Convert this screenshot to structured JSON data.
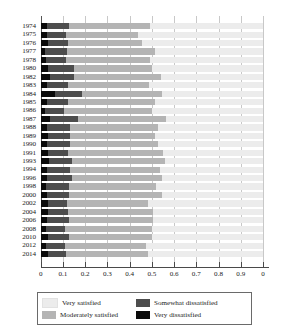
{
  "chart_data": {
    "type": "bar",
    "subtype": "stacked-horizontal-100",
    "title": "",
    "xlabel": "",
    "ylabel": "",
    "xlim": [
      0,
      1
    ],
    "ylim": null,
    "grid": true,
    "legend_position": "bottom",
    "x_tick_labels": [
      "0",
      "0.1",
      "0.2",
      "0.3",
      "0.4",
      "0.5",
      "0.6",
      "0.7",
      "0.8",
      "0.9",
      "0"
    ],
    "x_tick_values": [
      0,
      0.1,
      0.2,
      0.3,
      0.4,
      0.5,
      0.6,
      0.7,
      0.8,
      0.9,
      1.0
    ],
    "categories": [
      "1974",
      "1975",
      "1976",
      "1977",
      "1978",
      "1980",
      "1982",
      "1983",
      "1984",
      "1985",
      "1986",
      "1987",
      "1988",
      "1989",
      "1990",
      "1991",
      "1993",
      "1994",
      "1996",
      "1998",
      "2000",
      "2002",
      "2004",
      "2006",
      "2008",
      "2010",
      "2012",
      "2014"
    ],
    "series": [
      {
        "name": "Very dissatisfied",
        "color": "#0a0a0a",
        "values": [
          0.027,
          0.03,
          0.031,
          0.02,
          0.025,
          0.031,
          0.042,
          0.029,
          0.063,
          0.027,
          0.02,
          0.042,
          0.03,
          0.031,
          0.03,
          0.031,
          0.038,
          0.029,
          0.03,
          0.026,
          0.028,
          0.034,
          0.031,
          0.03,
          0.023,
          0.032,
          0.025,
          0.031
        ]
      },
      {
        "name": "Somewhat dissatisfied",
        "color": "#4d4d4d",
        "values": [
          0.099,
          0.083,
          0.094,
          0.097,
          0.09,
          0.121,
          0.108,
          0.094,
          0.122,
          0.097,
          0.083,
          0.127,
          0.103,
          0.101,
          0.101,
          0.09,
          0.102,
          0.101,
          0.112,
          0.102,
          0.101,
          0.085,
          0.091,
          0.098,
          0.088,
          0.096,
          0.085,
          0.083
        ]
      },
      {
        "name": "Moderately satisfied",
        "color": "#b4b4b4",
        "values": [
          0.364,
          0.327,
          0.33,
          0.396,
          0.375,
          0.348,
          0.39,
          0.365,
          0.363,
          0.39,
          0.4,
          0.393,
          0.396,
          0.384,
          0.399,
          0.431,
          0.421,
          0.406,
          0.406,
          0.392,
          0.415,
          0.363,
          0.382,
          0.378,
          0.389,
          0.372,
          0.366,
          0.367
        ]
      },
      {
        "name": "Very satisfied",
        "color": "#ececec",
        "values": [
          0.51,
          0.56,
          0.545,
          0.487,
          0.51,
          0.5,
          0.46,
          0.512,
          0.452,
          0.486,
          0.497,
          0.438,
          0.471,
          0.484,
          0.47,
          0.448,
          0.439,
          0.464,
          0.452,
          0.48,
          0.456,
          0.518,
          0.496,
          0.494,
          0.5,
          0.5,
          0.524,
          0.519
        ]
      }
    ],
    "legend": [
      {
        "label": "Very satisfied",
        "color": "#ececec"
      },
      {
        "label": "Somewhat dissatisfied",
        "color": "#4d4d4d"
      },
      {
        "label": "Moderately satisfied",
        "color": "#b4b4b4"
      },
      {
        "label": "Very dissatisfied",
        "color": "#0a0a0a"
      }
    ]
  },
  "colors": {
    "very_satisfied": "#ececec",
    "moderately_satisfied": "#b4b4b4",
    "somewhat_dissatisfied": "#4d4d4d",
    "very_dissatisfied": "#0a0a0a",
    "gridline": "#c8c8c8",
    "axis": "#4a4a4a",
    "background": "#ffffff"
  }
}
